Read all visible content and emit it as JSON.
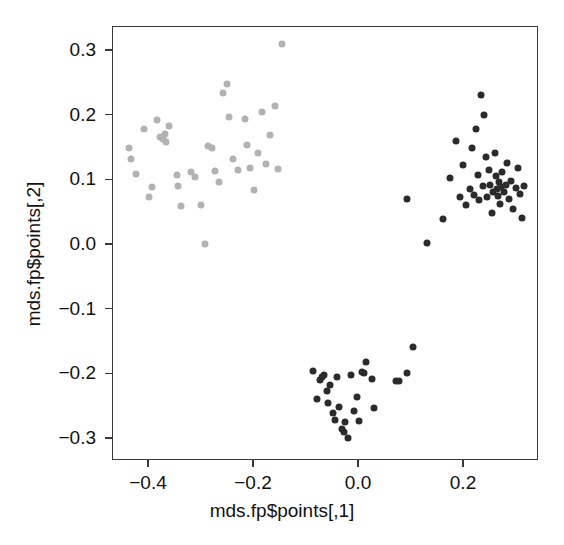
{
  "chart_data": {
    "type": "scatter",
    "title": "",
    "xlabel": "mds.fp$points[,1]",
    "ylabel": "mds.fp$points[,2]",
    "xlim": [
      -0.455,
      0.345
    ],
    "ylim": [
      -0.332,
      0.332
    ],
    "xticks": [
      -0.4,
      -0.2,
      0.0,
      0.2
    ],
    "xticklabels": [
      "-0.4",
      "-0.2",
      "0.0",
      "0.2"
    ],
    "yticks": [
      -0.3,
      -0.2,
      -0.1,
      0.0,
      0.1,
      0.2,
      0.3
    ],
    "yticklabels": [
      "-0.3",
      "-0.2",
      "-0.1",
      "0.0",
      "0.1",
      "0.2",
      "0.3"
    ],
    "grid": false,
    "legend": null,
    "marker": "filled-circle",
    "marker_size_px": 7,
    "series": [
      {
        "name": "cluster-light-gray",
        "color": "#b2b2b2",
        "points": [
          [
            -0.437,
            0.148
          ],
          [
            -0.433,
            0.131
          ],
          [
            -0.423,
            0.109
          ],
          [
            -0.408,
            0.178
          ],
          [
            -0.398,
            0.072
          ],
          [
            -0.392,
            0.088
          ],
          [
            -0.383,
            0.192
          ],
          [
            -0.378,
            0.166
          ],
          [
            -0.372,
            0.163
          ],
          [
            -0.368,
            0.17
          ],
          [
            -0.366,
            0.158
          ],
          [
            -0.36,
            0.182
          ],
          [
            -0.345,
            0.107
          ],
          [
            -0.342,
            0.089
          ],
          [
            -0.338,
            0.058
          ],
          [
            -0.318,
            0.112
          ],
          [
            -0.31,
            0.103
          ],
          [
            -0.3,
            0.06
          ],
          [
            -0.292,
            0.0
          ],
          [
            -0.286,
            0.152
          ],
          [
            -0.278,
            0.148
          ],
          [
            -0.272,
            0.113
          ],
          [
            -0.265,
            0.096
          ],
          [
            -0.258,
            0.234
          ],
          [
            -0.25,
            0.247
          ],
          [
            -0.245,
            0.197
          ],
          [
            -0.238,
            0.131
          ],
          [
            -0.228,
            0.114
          ],
          [
            -0.215,
            0.193
          ],
          [
            -0.212,
            0.153
          ],
          [
            -0.205,
            0.118
          ],
          [
            -0.198,
            0.084
          ],
          [
            -0.19,
            0.14
          ],
          [
            -0.182,
            0.204
          ],
          [
            -0.176,
            0.123
          ],
          [
            -0.168,
            0.168
          ],
          [
            -0.158,
            0.213
          ],
          [
            -0.152,
            0.116
          ],
          [
            -0.145,
            0.31
          ]
        ]
      },
      {
        "name": "cluster-dark-right",
        "color": "#2b2b2b",
        "points": [
          [
            0.094,
            0.07
          ],
          [
            0.132,
            0.002
          ],
          [
            0.162,
            0.038
          ],
          [
            0.176,
            0.102
          ],
          [
            0.186,
            0.16
          ],
          [
            0.194,
            0.073
          ],
          [
            0.2,
            0.122
          ],
          [
            0.205,
            0.06
          ],
          [
            0.213,
            0.085
          ],
          [
            0.218,
            0.148
          ],
          [
            0.22,
            0.076
          ],
          [
            0.224,
            0.178
          ],
          [
            0.228,
            0.106
          ],
          [
            0.231,
            0.068
          ],
          [
            0.234,
            0.23
          ],
          [
            0.238,
            0.089
          ],
          [
            0.24,
            0.2
          ],
          [
            0.243,
            0.135
          ],
          [
            0.246,
            0.072
          ],
          [
            0.249,
            0.115
          ],
          [
            0.252,
            0.092
          ],
          [
            0.255,
            0.048
          ],
          [
            0.258,
            0.08
          ],
          [
            0.26,
            0.14
          ],
          [
            0.262,
            0.105
          ],
          [
            0.264,
            0.085
          ],
          [
            0.266,
            0.075
          ],
          [
            0.268,
            0.096
          ],
          [
            0.27,
            0.062
          ],
          [
            0.272,
            0.088
          ],
          [
            0.275,
            0.112
          ],
          [
            0.278,
            0.08
          ],
          [
            0.281,
            0.091
          ],
          [
            0.284,
            0.126
          ],
          [
            0.288,
            0.07
          ],
          [
            0.292,
            0.098
          ],
          [
            0.296,
            0.054
          ],
          [
            0.3,
            0.086
          ],
          [
            0.304,
            0.118
          ],
          [
            0.308,
            0.078
          ],
          [
            0.312,
            0.04
          ],
          [
            0.316,
            0.09
          ]
        ]
      },
      {
        "name": "cluster-dark-bottom",
        "color": "#2b2b2b",
        "points": [
          [
            -0.086,
            -0.196
          ],
          [
            -0.078,
            -0.24
          ],
          [
            -0.072,
            -0.21
          ],
          [
            -0.068,
            -0.206
          ],
          [
            -0.064,
            -0.202
          ],
          [
            -0.06,
            -0.228
          ],
          [
            -0.058,
            -0.246
          ],
          [
            -0.054,
            -0.218
          ],
          [
            -0.048,
            -0.262
          ],
          [
            -0.044,
            -0.272
          ],
          [
            -0.04,
            -0.205
          ],
          [
            -0.036,
            -0.252
          ],
          [
            -0.03,
            -0.286
          ],
          [
            -0.027,
            -0.29
          ],
          [
            -0.024,
            -0.276
          ],
          [
            -0.02,
            -0.3
          ],
          [
            -0.014,
            -0.202
          ],
          [
            -0.008,
            -0.258
          ],
          [
            -0.002,
            -0.236
          ],
          [
            0.002,
            -0.274
          ],
          [
            0.008,
            -0.198
          ],
          [
            0.012,
            -0.2
          ],
          [
            0.016,
            -0.182
          ],
          [
            0.026,
            -0.208
          ],
          [
            0.03,
            -0.254
          ],
          [
            0.072,
            -0.212
          ],
          [
            0.078,
            -0.212
          ],
          [
            0.094,
            -0.2
          ],
          [
            0.104,
            -0.16
          ]
        ]
      }
    ]
  }
}
